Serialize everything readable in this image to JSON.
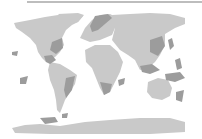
{
  "map": {
    "type": "world-map",
    "projection": "equirectangular-like",
    "colors": {
      "background": "#ffffff",
      "land": "#c9c9c9",
      "highlight": "#9c9c9c",
      "top_rule": "#bdbdbd"
    },
    "highlighted_regions": [
      "Scandinavia / Northern Europe",
      "Eastern United States",
      "Central America / Mexico",
      "Eastern South America",
      "Southern Africa / Madagascar",
      "East Asia coast / Japan",
      "Southeast Asia / Indonesia",
      "New Guinea / Melanesia",
      "New Zealand",
      "Hawaii",
      "Patagonia / Falklands"
    ]
  }
}
